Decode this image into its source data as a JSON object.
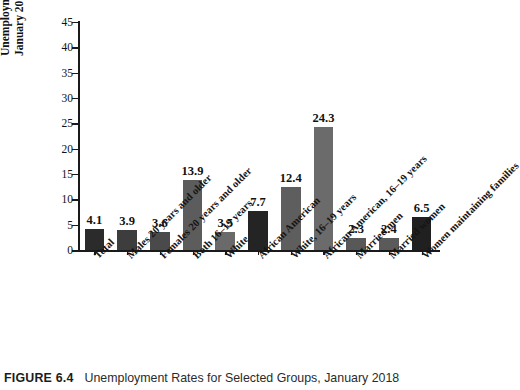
{
  "figure": {
    "caption_label": "FIGURE 6.4",
    "caption_text": "Unemployment Rates for Selected Groups, January 2018"
  },
  "axis": {
    "y_title_line1": "Unemployment rates,",
    "y_title_line2": "January 2018 (in percent)"
  },
  "chart_data": {
    "type": "bar",
    "title": "Unemployment Rates for Selected Groups, January 2018",
    "xlabel": "",
    "ylabel": "Unemployment rates, January 2018 (in percent)",
    "ylim": [
      0,
      45
    ],
    "yticks": [
      0,
      5,
      10,
      15,
      20,
      25,
      30,
      35,
      40,
      45
    ],
    "ytick_labels": [
      "0",
      "5",
      "10",
      "15",
      "20",
      "25",
      "30",
      "35",
      "40",
      "45"
    ],
    "grid": false,
    "legend": "none",
    "value_labels_shown": true,
    "categories": [
      "Total",
      "Males 20 years and older",
      "Females 20 years and older",
      "Both 16–19 years",
      "White",
      "African American",
      "White, 16–19 years",
      "African American, 16–19 years",
      "Married men",
      "Married women",
      "Women maintaining families"
    ],
    "values": [
      4.1,
      3.9,
      3.6,
      13.9,
      3.5,
      7.7,
      12.4,
      24.3,
      2.3,
      2.4,
      6.5
    ],
    "value_text": [
      "4.1",
      "3.9",
      "3.6",
      "13.9",
      "3.5",
      "7.7",
      "12.4",
      "24.3",
      "2.3",
      "2.4",
      "6.5"
    ],
    "bar_colors": [
      "#2b2b2b",
      "#3d3d3d",
      "#4a4a4a",
      "#5c5c5c",
      "#6a6a6a",
      "#242424",
      "#5e5e5e",
      "#6b6b6b",
      "#585858",
      "#5a5a5a",
      "#202020"
    ],
    "axis_color": "#1a1a1a"
  }
}
